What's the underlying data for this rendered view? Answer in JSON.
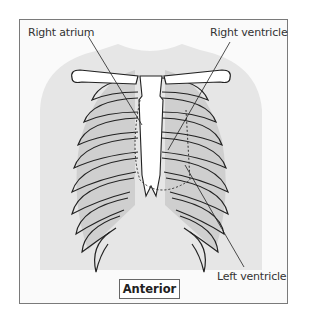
{
  "figure": {
    "labels": {
      "right_atrium": "Right atrium",
      "right_ventricle": "Right ventricle",
      "left_ventricle": "Left ventricle"
    },
    "view_label": "Anterior"
  },
  "colors": {
    "frame_border": "#7a7a7a",
    "background": "#fafafa",
    "body_silhouette": "#e6e6e6",
    "lung_shading": "#cfcfcf",
    "line": "#222222"
  }
}
